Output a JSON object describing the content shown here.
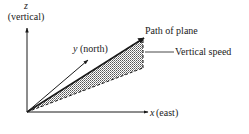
{
  "diagram": {
    "axes": {
      "z": {
        "symbol": "z",
        "description": "(vertical)"
      },
      "y": {
        "symbol": "y",
        "description": "(north)"
      },
      "x": {
        "symbol": "x",
        "description": "(east)"
      }
    },
    "labels": {
      "path": "Path of plane",
      "vertical_speed": "Vertical speed"
    },
    "colors": {
      "line": "#1a1a1a",
      "shade": "#9a9a9a",
      "background": "#ffffff"
    }
  }
}
